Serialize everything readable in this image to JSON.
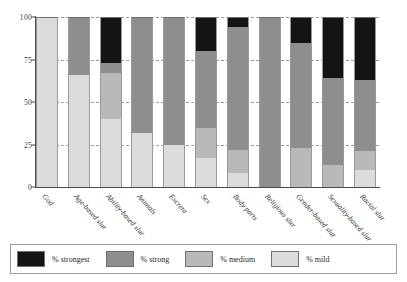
{
  "chart_data": {
    "type": "bar",
    "stacked": true,
    "title": "",
    "subtitle": "",
    "xlabel": "",
    "ylabel": "",
    "ylim": [
      0,
      100
    ],
    "yticks": [
      0,
      25,
      50,
      75,
      100
    ],
    "ytick_labels": [
      "0",
      "25",
      "50",
      "75",
      "100"
    ],
    "grid": true,
    "grid_style": "dashed horizontal",
    "legend_position": "bottom",
    "categories": [
      "God",
      "Age-based slur",
      "Ability-based slur",
      "Animals",
      "Excreta",
      "Sex",
      "Body parts",
      "Religious slur",
      "Gender-based slur",
      "Sexuality-based slur",
      "Racial slur"
    ],
    "series": [
      {
        "name": "% strongest",
        "color": "#141414",
        "values": [
          0,
          0,
          27,
          0,
          0,
          20,
          6,
          0,
          15,
          36,
          37
        ]
      },
      {
        "name": "% strong",
        "color": "#8e8e8e",
        "values": [
          0,
          34,
          6,
          68,
          75,
          45,
          72,
          100,
          62,
          51,
          42
        ]
      },
      {
        "name": "% medium",
        "color": "#b9b9b9",
        "values": [
          0,
          0,
          27,
          0,
          0,
          18,
          14,
          0,
          23,
          13,
          11
        ]
      },
      {
        "name": "% mild",
        "color": "#dcdcdc",
        "values": [
          100,
          66,
          40,
          32,
          25,
          17,
          8,
          0,
          0,
          0,
          10
        ]
      }
    ]
  },
  "legend": {
    "items": [
      {
        "label": "% strongest",
        "swatch": "sw-strongest"
      },
      {
        "label": "% strong",
        "swatch": "sw-strong"
      },
      {
        "label": "% medium",
        "swatch": "sw-medium"
      },
      {
        "label": "% mild",
        "swatch": "sw-mild"
      }
    ]
  }
}
